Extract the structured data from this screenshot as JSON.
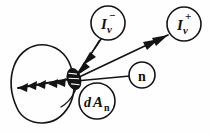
{
  "figure": {
    "background_color": "#fefefe",
    "ink_color": "#141414"
  },
  "labels": {
    "incoming_radiance": {
      "name": "I-nu-minus",
      "base": "I",
      "superscript": "−",
      "subscript": "ν",
      "meaning": "incoming radiance"
    },
    "outgoing_radiance": {
      "name": "I-nu-plus",
      "base": "I",
      "superscript": "+",
      "subscript": "ν",
      "meaning": "outgoing radiance"
    },
    "normal_vector": {
      "name": "surface-normal",
      "text": "n",
      "meaning": "unit surface normal vector"
    },
    "area_element": {
      "name": "area-element",
      "base_d": "d",
      "base_a": "A",
      "subscript": "n",
      "meaning": "differential area element normal to n"
    }
  },
  "elements": {
    "volume_blob": "closed irregular body outline",
    "surface_patch": "small hatched ellipse surface element",
    "ray_incoming": "arrow directed into the surface patch",
    "ray_outgoing": "arrow directed away from the surface patch",
    "ray_bundle_left": "multi-headed arrow passing leftward through the body",
    "leader_normal": "leader line from patch to normal label"
  }
}
